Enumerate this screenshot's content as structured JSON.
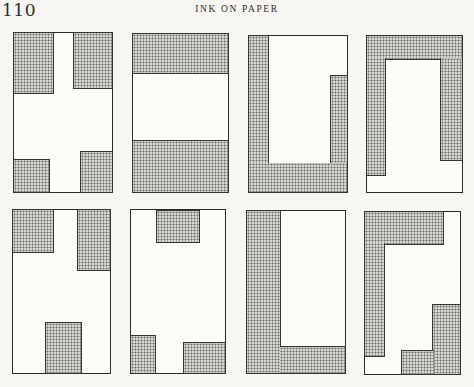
{
  "page": {
    "number": "110",
    "running_head": "INK ON PAPER"
  },
  "figures": {
    "count": 8,
    "layout": "2 rows x 4 columns of stippled compositional diagrams",
    "fill_pattern": "dot-stipple",
    "colors": {
      "ink": "#2b2b2b",
      "stipple": "#6f6f6c",
      "paper": "#f7f6f2"
    },
    "panels": [
      {
        "id": 1,
        "description": "four corner blocks forming a white cross"
      },
      {
        "id": 2,
        "description": "top and bottom horizontal bands"
      },
      {
        "id": 3,
        "description": "U shape open at top right"
      },
      {
        "id": 4,
        "description": "inverted U with gap at bottom"
      },
      {
        "id": 5,
        "description": "two top blocks and bottom-center block"
      },
      {
        "id": 6,
        "description": "top-center block and two bottom corner blocks"
      },
      {
        "id": 7,
        "description": "L shape, left column and bottom band"
      },
      {
        "id": 8,
        "description": "interlocking reverse-L and stepped L shapes"
      }
    ]
  }
}
